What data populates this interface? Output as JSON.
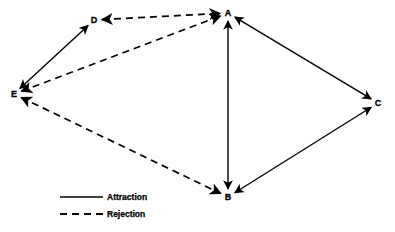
{
  "figure": {
    "type": "sociogram-diagram",
    "background_color": "#ffffff",
    "line_color": "#000000",
    "width": 395,
    "height": 232
  },
  "nodes": [
    {
      "id": "A",
      "label": "A",
      "x": 228,
      "y": 13
    },
    {
      "id": "B",
      "label": "B",
      "x": 228,
      "y": 197
    },
    {
      "id": "C",
      "label": "C",
      "x": 378,
      "y": 103
    },
    {
      "id": "D",
      "label": "D",
      "x": 94,
      "y": 20
    },
    {
      "id": "E",
      "label": "E",
      "x": 14,
      "y": 94
    }
  ],
  "edges": [
    {
      "from": "D",
      "to": "E",
      "style": "solid",
      "relation": "Attraction",
      "arrows": "both"
    },
    {
      "from": "A",
      "to": "B",
      "style": "solid",
      "relation": "Attraction",
      "arrows": "both"
    },
    {
      "from": "A",
      "to": "C",
      "style": "solid",
      "relation": "Attraction",
      "arrows": "both"
    },
    {
      "from": "B",
      "to": "C",
      "style": "solid",
      "relation": "Attraction",
      "arrows": "both"
    },
    {
      "from": "D",
      "to": "A",
      "style": "dashed",
      "relation": "Rejection",
      "arrows": "both"
    },
    {
      "from": "E",
      "to": "A",
      "style": "dashed",
      "relation": "Rejection",
      "arrows": "both"
    },
    {
      "from": "E",
      "to": "B",
      "style": "dashed",
      "relation": "Rejection",
      "arrows": "both"
    }
  ],
  "legend": {
    "items": [
      {
        "key": "attraction",
        "label": "Attraction",
        "style": "solid",
        "line_x1": 60,
        "line_x2": 103,
        "line_y": 197,
        "text_x": 107,
        "text_y": 197
      },
      {
        "key": "rejection",
        "label": "Rejection",
        "style": "dashed",
        "line_x1": 60,
        "line_x2": 103,
        "line_y": 214,
        "text_x": 107,
        "text_y": 214
      }
    ]
  }
}
